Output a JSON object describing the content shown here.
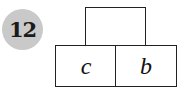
{
  "problem_number": "12",
  "diagram": {
    "top_box": {
      "label": ""
    },
    "bottom_left_box": {
      "label": "c"
    },
    "bottom_right_box": {
      "label": "b"
    }
  },
  "colors": {
    "badge_background": "#c9c9c9",
    "stroke": "#222222"
  }
}
